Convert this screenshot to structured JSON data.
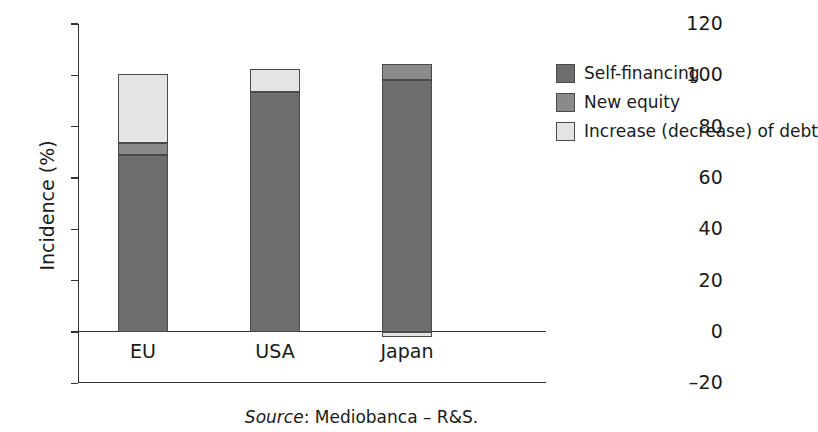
{
  "chart_data": {
    "type": "bar",
    "subtype": "stacked-bar",
    "title": "",
    "xlabel": "",
    "ylabel": "Incidence (%)",
    "ylim": [
      -20,
      120
    ],
    "yticks": [
      120,
      100,
      80,
      60,
      40,
      20,
      0,
      -20
    ],
    "ytick_labels": [
      "120",
      "100",
      "80",
      "60",
      "40",
      "20",
      "0",
      "–20"
    ],
    "grid": false,
    "legend_position": "right",
    "categories": [
      "EU",
      "USA",
      "Japan"
    ],
    "series": [
      {
        "name": "Self-financing",
        "color": "#6e6e6e",
        "values": [
          69.0,
          93.5,
          98.0
        ]
      },
      {
        "name": "New equity",
        "color": "#8a8a8a",
        "values": [
          4.5,
          0.0,
          6.5
        ]
      },
      {
        "name": "Increase (decrease) of debt",
        "color": "#e4e4e4",
        "values": [
          27.0,
          9.0,
          -2.0
        ]
      }
    ],
    "totals": [
      100.5,
      102.5,
      104.5
    ],
    "source_prefix": "Source",
    "source_text": ": Mediobanca – R&S."
  },
  "axis": {
    "y_title": "Incidence (%)",
    "ticks": [
      {
        "label": "120",
        "value": 120
      },
      {
        "label": "100",
        "value": 100
      },
      {
        "label": "80",
        "value": 80
      },
      {
        "label": "60",
        "value": 60
      },
      {
        "label": "40",
        "value": 40
      },
      {
        "label": "20",
        "value": 20
      },
      {
        "label": "0",
        "value": 0
      },
      {
        "label": "–20",
        "value": -20
      }
    ]
  },
  "categories": [
    {
      "label": "EU"
    },
    {
      "label": "USA"
    },
    {
      "label": "Japan"
    }
  ],
  "legend": {
    "items": [
      {
        "label": "Self-financing",
        "color": "#6e6e6e"
      },
      {
        "label": "New equity",
        "color": "#8a8a8a"
      },
      {
        "label": "Increase (decrease) of debt",
        "color": "#e4e4e4"
      }
    ]
  },
  "footer": {
    "source_prefix": "Source",
    "source_rest": ": Mediobanca – R&S."
  }
}
